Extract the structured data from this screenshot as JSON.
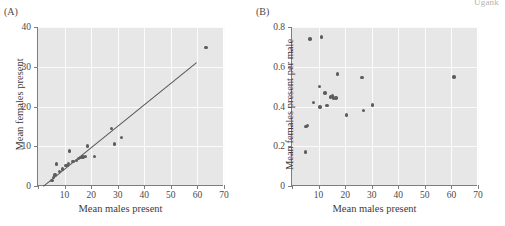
{
  "figure": {
    "corner_text": "Ugank",
    "panels": [
      {
        "id": "A",
        "label": "(A)"
      },
      {
        "id": "B",
        "label": "(B)"
      }
    ]
  },
  "chart_data": [
    {
      "type": "scatter",
      "panel": "(A)",
      "title": "",
      "xlabel": "Mean males present",
      "ylabel": "Mean females present",
      "xlim": [
        0,
        70
      ],
      "ylim": [
        0,
        40
      ],
      "xticks": [
        0,
        10,
        20,
        30,
        40,
        50,
        60,
        70
      ],
      "xticklabels": [
        "",
        "10",
        "20",
        "30",
        "40",
        "50",
        "60",
        "70"
      ],
      "yticks": [
        0,
        10,
        20,
        30,
        40
      ],
      "yticklabels": [
        "0",
        "10",
        "20",
        "30",
        "40"
      ],
      "grid": true,
      "points": [
        {
          "x": 5.2,
          "y": 1.4
        },
        {
          "x": 5.8,
          "y": 2.2
        },
        {
          "x": 6.4,
          "y": 2.8
        },
        {
          "x": 7.0,
          "y": 5.5
        },
        {
          "x": 8.0,
          "y": 3.6
        },
        {
          "x": 9.2,
          "y": 4.3
        },
        {
          "x": 10.3,
          "y": 5.2
        },
        {
          "x": 10.9,
          "y": 5.1
        },
        {
          "x": 11.4,
          "y": 5.6
        },
        {
          "x": 11.8,
          "y": 8.8
        },
        {
          "x": 13.2,
          "y": 6.1
        },
        {
          "x": 14.4,
          "y": 6.4
        },
        {
          "x": 15.3,
          "y": 6.9
        },
        {
          "x": 16.2,
          "y": 7.2
        },
        {
          "x": 17.0,
          "y": 7.3
        },
        {
          "x": 17.8,
          "y": 7.4
        },
        {
          "x": 18.6,
          "y": 10.1
        },
        {
          "x": 21.3,
          "y": 7.5
        },
        {
          "x": 27.6,
          "y": 14.5
        },
        {
          "x": 28.8,
          "y": 10.6
        },
        {
          "x": 31.4,
          "y": 12.2
        },
        {
          "x": 63.2,
          "y": 34.8
        }
      ],
      "regression_line": {
        "x0": 2.0,
        "y0": 0.0,
        "x1": 59.8,
        "y1": 31.2
      },
      "has_regression_line": true
    },
    {
      "type": "scatter",
      "panel": "(B)",
      "title": "",
      "xlabel": "Mean males present",
      "ylabel": "Mean females present per male",
      "xlim": [
        0,
        70
      ],
      "ylim": [
        0,
        0.8
      ],
      "xticks": [
        0,
        10,
        20,
        30,
        40,
        50,
        60,
        70
      ],
      "xticklabels": [
        "",
        "10",
        "20",
        "30",
        "40",
        "50",
        "60",
        "70"
      ],
      "yticks": [
        0,
        0.2,
        0.4,
        0.6,
        0.8
      ],
      "yticklabels": [
        "0",
        "0.2",
        "0.4",
        "0.6",
        "0.8"
      ],
      "grid": true,
      "points": [
        {
          "x": 5.0,
          "y": 0.172
        },
        {
          "x": 5.2,
          "y": 0.298
        },
        {
          "x": 5.8,
          "y": 0.305
        },
        {
          "x": 6.8,
          "y": 0.74
        },
        {
          "x": 8.2,
          "y": 0.42
        },
        {
          "x": 10.4,
          "y": 0.5
        },
        {
          "x": 10.6,
          "y": 0.398
        },
        {
          "x": 11.0,
          "y": 0.75
        },
        {
          "x": 12.4,
          "y": 0.468
        },
        {
          "x": 13.2,
          "y": 0.404
        },
        {
          "x": 14.4,
          "y": 0.448
        },
        {
          "x": 15.2,
          "y": 0.452
        },
        {
          "x": 15.6,
          "y": 0.442
        },
        {
          "x": 16.6,
          "y": 0.443
        },
        {
          "x": 17.2,
          "y": 0.563
        },
        {
          "x": 20.6,
          "y": 0.358
        },
        {
          "x": 26.4,
          "y": 0.545
        },
        {
          "x": 27.0,
          "y": 0.379
        },
        {
          "x": 30.4,
          "y": 0.408
        },
        {
          "x": 61.0,
          "y": 0.549
        }
      ],
      "has_regression_line": false
    }
  ]
}
